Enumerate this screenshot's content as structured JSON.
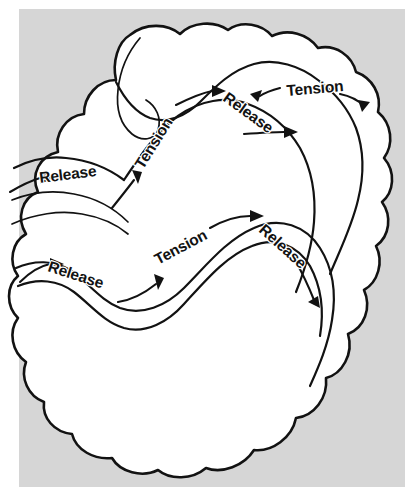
{
  "figure": {
    "background_color": "#d6d6d6",
    "shape_fill_color": "#ffffff",
    "ink_color": "#121212",
    "canvas": {
      "width": 419,
      "height": 493
    },
    "panel": {
      "x": 19,
      "y": 9,
      "width": 386,
      "height": 478
    }
  },
  "labels": {
    "release": "Release",
    "tension": "Tension"
  },
  "annotations": [
    {
      "id": "upper-band-release-left",
      "text": "Release",
      "band": "upper",
      "position": {
        "x": 40,
        "y": 183
      },
      "rotation": -7,
      "arrow_direction": "right"
    },
    {
      "id": "upper-band-tension-diagonal",
      "text": "Tension",
      "band": "upper",
      "position": {
        "x": 143,
        "y": 170
      },
      "rotation": -58,
      "arrow_direction": "up-right"
    },
    {
      "id": "upper-band-release-crest",
      "text": "Release",
      "band": "upper",
      "position": {
        "x": 222,
        "y": 100
      },
      "rotation": 36,
      "arrow_direction": "right"
    },
    {
      "id": "upper-band-tension-right",
      "text": "Tension",
      "band": "upper",
      "position": {
        "x": 287,
        "y": 96
      },
      "rotation": -5,
      "arrow_direction": "right"
    },
    {
      "id": "lower-band-release-left",
      "text": "Release",
      "band": "lower",
      "position": {
        "x": 47,
        "y": 271
      },
      "rotation": 18,
      "arrow_direction": "right"
    },
    {
      "id": "lower-band-tension-rising",
      "text": "Tension",
      "band": "lower",
      "position": {
        "x": 158,
        "y": 265
      },
      "rotation": -28,
      "arrow_direction": "up-right"
    },
    {
      "id": "lower-band-release-crest",
      "text": "Release",
      "band": "lower",
      "position": {
        "x": 258,
        "y": 231
      },
      "rotation": 42,
      "arrow_direction": "down-right"
    }
  ]
}
